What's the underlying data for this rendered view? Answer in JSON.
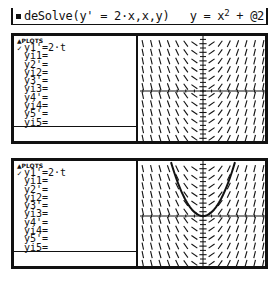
{
  "entry_line": {
    "command": "deSolve(y' = 2·x,x,y)",
    "result_prefix": "y = x",
    "result_exponent": "2",
    "result_suffix": " + @2"
  },
  "panels": [
    {
      "header": "▲PLOTS",
      "equations": [
        {
          "check": "✓",
          "label": "y1'=2·t"
        },
        {
          "check": "",
          "label": "yi1="
        },
        {
          "check": "",
          "label": "y2'="
        },
        {
          "check": "",
          "label": "yi2="
        },
        {
          "check": "",
          "label": "y3'="
        },
        {
          "check": "",
          "label": "yi3="
        },
        {
          "check": "",
          "label": "y4'="
        },
        {
          "check": "",
          "label": "yi4="
        },
        {
          "check": "",
          "label": "y5'="
        },
        {
          "check": "",
          "label": "yi5="
        }
      ],
      "edit_line": "",
      "graph": {
        "type": "slope_field",
        "equation": "y'=2t",
        "solution_curve": false
      }
    },
    {
      "header": "▲PLOTS",
      "equations": [
        {
          "check": "✓",
          "label": "y1'=2·t"
        },
        {
          "check": "",
          "label": "yi1="
        },
        {
          "check": "",
          "label": "y2'="
        },
        {
          "check": "",
          "label": "yi2="
        },
        {
          "check": "",
          "label": "y3'="
        },
        {
          "check": "",
          "label": "yi3="
        },
        {
          "check": "",
          "label": "y4'="
        },
        {
          "check": "",
          "label": "yi4="
        },
        {
          "check": "",
          "label": "y5'="
        },
        {
          "check": "",
          "label": "yi5="
        }
      ],
      "edit_line": "",
      "graph": {
        "type": "slope_field",
        "equation": "y'=2t",
        "solution_curve": "y=x^2"
      }
    }
  ],
  "colors": {
    "ink": "#111111",
    "background": "#ffffff"
  }
}
